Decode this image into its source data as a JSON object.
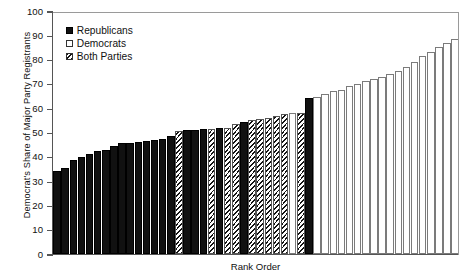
{
  "chart_data": {
    "type": "bar",
    "title": "",
    "xlabel": "Rank Order",
    "ylabel": "Democrat's Share of Major Party Registrants",
    "ylim": [
      0,
      100
    ],
    "yticks": [
      0,
      10,
      20,
      30,
      40,
      50,
      60,
      70,
      80,
      90,
      100
    ],
    "grid": false,
    "legend_position": "top-left",
    "legend": [
      {
        "key": "rep",
        "label": "Republicans",
        "swatch": "solid-black"
      },
      {
        "key": "dem",
        "label": "Democrats",
        "swatch": "open-white"
      },
      {
        "key": "both",
        "label": "Both Parties",
        "swatch": "hatched"
      }
    ],
    "categories": [
      1,
      2,
      3,
      4,
      5,
      6,
      7,
      8,
      9,
      10,
      11,
      12,
      13,
      14,
      15,
      16,
      17,
      18,
      19,
      20,
      21,
      22,
      23,
      24,
      25,
      26,
      27,
      28,
      29,
      30,
      31,
      32,
      33,
      34,
      35,
      36,
      37,
      38,
      39,
      40,
      41,
      42,
      43,
      44,
      45,
      46,
      47,
      48,
      49,
      50
    ],
    "values": [
      34,
      35.5,
      38.5,
      40,
      41,
      42.5,
      43,
      44.5,
      45.5,
      45.5,
      46,
      46.5,
      47,
      47.5,
      48.5,
      50.5,
      51,
      51,
      51.5,
      51.5,
      52,
      52,
      53.5,
      54.5,
      55,
      55.5,
      56,
      57,
      57.5,
      58,
      58,
      64,
      64.5,
      66,
      67,
      67.5,
      69,
      70,
      71,
      72,
      73,
      74,
      75.5,
      77,
      79,
      81.5,
      83,
      85,
      87,
      88.5
    ],
    "series_groups": [
      "rep",
      "rep",
      "rep",
      "rep",
      "rep",
      "rep",
      "rep",
      "rep",
      "rep",
      "rep",
      "rep",
      "rep",
      "rep",
      "rep",
      "rep",
      "both",
      "rep",
      "rep",
      "rep",
      "both",
      "rep",
      "both",
      "both",
      "rep",
      "both",
      "both",
      "both",
      "both",
      "both",
      "dem",
      "both",
      "rep",
      "dem",
      "dem",
      "dem",
      "dem",
      "dem",
      "dem",
      "dem",
      "dem",
      "dem",
      "dem",
      "dem",
      "dem",
      "dem",
      "dem",
      "dem",
      "dem",
      "dem",
      "dem"
    ]
  }
}
